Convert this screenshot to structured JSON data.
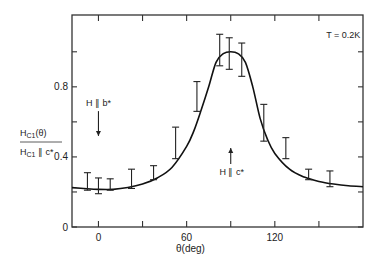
{
  "chart_data": {
    "type": "scatter",
    "title": "",
    "xlabel": "θ(deg)",
    "ylabel_numerator": "H",
    "ylabel_numerator_sub": "C1",
    "ylabel_numerator_tail": "(θ)",
    "ylabel_denominator": "H",
    "ylabel_denominator_sub": "C1",
    "ylabel_denominator_tail": " ∥ c*",
    "ylabel": "H_C1(θ) / H_C1 ∥ c*",
    "xlim": [
      -18,
      180
    ],
    "ylim": [
      0,
      1.21
    ],
    "x_ticks": [
      0,
      30,
      60,
      90,
      120,
      150
    ],
    "x_tick_labels": [
      "0",
      "",
      "60",
      "",
      "120",
      ""
    ],
    "y_ticks": [
      0,
      0.2,
      0.4,
      0.6,
      0.8,
      1.0
    ],
    "y_tick_labels": [
      "0",
      "",
      "0.4",
      "",
      "0.8",
      ""
    ],
    "grid": false,
    "legend": null,
    "annotations": [
      {
        "text": "T = 0.2K",
        "x": 155,
        "y": 1.08
      },
      {
        "text": "H ∥ b*",
        "x": 0,
        "y": 0.69,
        "arrow": "down",
        "arrow_to": 0.52
      },
      {
        "text": "H ∥ c*",
        "x": 90,
        "y": 0.32,
        "arrow": "up",
        "arrow_from": 0.36,
        "arrow_to": 0.52
      }
    ],
    "series": [
      {
        "name": "measured (error bars)",
        "kind": "errorbar",
        "points": [
          {
            "x": -7.5,
            "low": 0.21,
            "high": 0.31
          },
          {
            "x": 0,
            "low": 0.19,
            "high": 0.28
          },
          {
            "x": 8,
            "low": 0.21,
            "high": 0.275
          },
          {
            "x": 22.5,
            "low": 0.22,
            "high": 0.33
          },
          {
            "x": 37.5,
            "low": 0.27,
            "high": 0.35
          },
          {
            "x": 52.5,
            "low": 0.39,
            "high": 0.57
          },
          {
            "x": 67,
            "low": 0.66,
            "high": 0.83
          },
          {
            "x": 82.5,
            "low": 0.92,
            "high": 1.1
          },
          {
            "x": 89,
            "low": 0.9,
            "high": 1.08
          },
          {
            "x": 97.5,
            "low": 0.86,
            "high": 1.05
          },
          {
            "x": 112.5,
            "low": 0.49,
            "high": 0.7
          },
          {
            "x": 127.5,
            "low": 0.39,
            "high": 0.51
          },
          {
            "x": 143,
            "low": 0.27,
            "high": 0.33
          },
          {
            "x": 157.5,
            "low": 0.23,
            "high": 0.32
          }
        ]
      },
      {
        "name": "theory fit",
        "kind": "line",
        "x": [
          -18,
          -10,
          0,
          10,
          20,
          30,
          40,
          50,
          60,
          65,
          70,
          75,
          80,
          85,
          90,
          95,
          100,
          105,
          110,
          115,
          120,
          130,
          140,
          150,
          160,
          170,
          180
        ],
        "y": [
          0.225,
          0.22,
          0.215,
          0.215,
          0.225,
          0.245,
          0.28,
          0.34,
          0.46,
          0.55,
          0.67,
          0.8,
          0.94,
          0.99,
          1.0,
          0.99,
          0.94,
          0.8,
          0.62,
          0.5,
          0.42,
          0.33,
          0.285,
          0.26,
          0.245,
          0.235,
          0.23
        ]
      }
    ]
  }
}
